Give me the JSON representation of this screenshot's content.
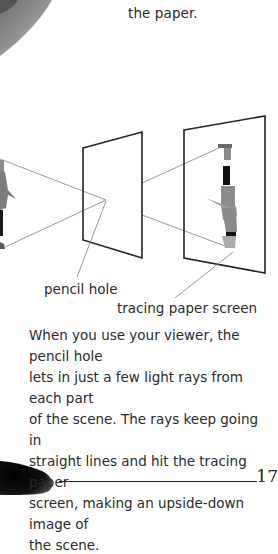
{
  "page": {
    "top_text_fragment": "the paper.",
    "diagram": {
      "labels": {
        "pinhole": "pencil hole",
        "screen": "tracing paper screen"
      }
    },
    "body_lines": [
      "When you use your viewer, the pencil hole",
      "lets in just a few light rays from each part",
      "of the scene. The rays keep going in",
      "straight lines and hit the tracing paper",
      "screen, making an upside-down image of",
      "the scene."
    ],
    "page_number": "17"
  }
}
